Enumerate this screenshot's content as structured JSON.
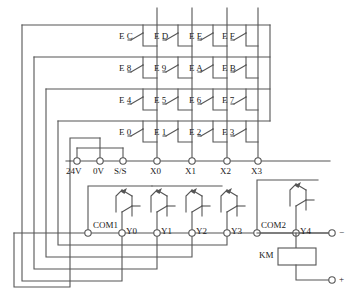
{
  "diagram": {
    "colors": {
      "wire": "#555555",
      "text": "#1a1a1a",
      "background": "#ffffff"
    }
  },
  "matrix": {
    "description": "4x4 scanned key matrix of momentary pushbutton switches",
    "rows": 4,
    "columns": 4,
    "switch_prefix": "E",
    "keys": [
      [
        {
          "label": "E C",
          "prefix": "E",
          "code": "C",
          "row": 0,
          "col": 0
        },
        {
          "label": "E D",
          "prefix": "E",
          "code": "D",
          "row": 0,
          "col": 1
        },
        {
          "label": "E E",
          "prefix": "E",
          "code": "E",
          "row": 0,
          "col": 2
        },
        {
          "label": "E F",
          "prefix": "E",
          "code": "F",
          "row": 0,
          "col": 3
        }
      ],
      [
        {
          "label": "E 8",
          "prefix": "E",
          "code": "8",
          "row": 1,
          "col": 0
        },
        {
          "label": "E 9",
          "prefix": "E",
          "code": "9",
          "row": 1,
          "col": 1
        },
        {
          "label": "E A",
          "prefix": "E",
          "code": "A",
          "row": 1,
          "col": 2
        },
        {
          "label": "E B",
          "prefix": "E",
          "code": "B",
          "row": 1,
          "col": 3
        }
      ],
      [
        {
          "label": "E 4",
          "prefix": "E",
          "code": "4",
          "row": 2,
          "col": 0
        },
        {
          "label": "E 5",
          "prefix": "E",
          "code": "5",
          "row": 2,
          "col": 1
        },
        {
          "label": "E 6",
          "prefix": "E",
          "code": "6",
          "row": 2,
          "col": 2
        },
        {
          "label": "E 7",
          "prefix": "E",
          "code": "7",
          "row": 2,
          "col": 3
        }
      ],
      [
        {
          "label": "E 0",
          "prefix": "E",
          "code": "0",
          "row": 3,
          "col": 0
        },
        {
          "label": "E 1",
          "prefix": "E",
          "code": "1",
          "row": 3,
          "col": 1
        },
        {
          "label": "E 2",
          "prefix": "E",
          "code": "2",
          "row": 3,
          "col": 2
        },
        {
          "label": "E 3",
          "prefix": "E",
          "code": "3",
          "row": 3,
          "col": 3
        }
      ]
    ],
    "row_drive_terminals": [
      "Y0",
      "Y1",
      "Y2",
      "Y3"
    ],
    "column_sense_terminals": [
      "X0",
      "X1",
      "X2",
      "X3"
    ]
  },
  "input_terminals": {
    "label_group": "PLC input terminal strip",
    "items": [
      {
        "name": "24V",
        "x": 77
      },
      {
        "name": "0V",
        "x": 100
      },
      {
        "name": "S/S",
        "x": 123
      },
      {
        "name": "X0",
        "x": 157
      },
      {
        "name": "X1",
        "x": 192
      },
      {
        "name": "X2",
        "x": 227
      },
      {
        "name": "X3",
        "x": 258
      }
    ]
  },
  "output_terminals": {
    "label_group": "PLC output terminal strip",
    "items": [
      {
        "name": "COM1",
        "x": 88,
        "label_side": "right"
      },
      {
        "name": "Y0",
        "x": 122,
        "label_side": "right"
      },
      {
        "name": "Y1",
        "x": 157,
        "label_side": "right"
      },
      {
        "name": "Y2",
        "x": 192,
        "label_side": "right"
      },
      {
        "name": "Y3",
        "x": 227,
        "label_side": "right"
      },
      {
        "name": "COM2",
        "x": 257,
        "label_side": "right"
      },
      {
        "name": "Y4",
        "x": 296,
        "label_side": "right"
      }
    ]
  },
  "load": {
    "name": "KM",
    "type": "contactor coil",
    "driven_by": "Y4"
  },
  "power": {
    "negative": "−",
    "positive": "+"
  }
}
